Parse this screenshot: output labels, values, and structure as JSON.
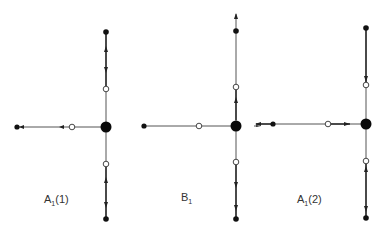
{
  "figures": [
    {
      "id": "A1_1",
      "label_main": "A",
      "label_sub": "1",
      "label_suffix": "(1)",
      "center": [
        106,
        127
      ],
      "label_pos": [
        44,
        193
      ]
    },
    {
      "id": "B1",
      "label_main": "B",
      "label_sub": "1",
      "label_suffix": "",
      "center": [
        236,
        126
      ],
      "label_pos": [
        181,
        191
      ]
    },
    {
      "id": "A1_2",
      "label_main": "A",
      "label_sub": "1",
      "label_suffix": "(2)",
      "center": [
        366,
        124
      ],
      "label_pos": [
        297,
        193
      ]
    }
  ],
  "colors": {
    "background": "#ffffff",
    "edge": "#555555",
    "node": "#111111"
  }
}
